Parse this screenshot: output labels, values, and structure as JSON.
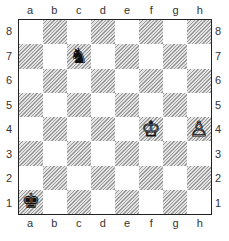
{
  "board": {
    "files": [
      "a",
      "b",
      "c",
      "d",
      "e",
      "f",
      "g",
      "h"
    ],
    "ranks": [
      "8",
      "7",
      "6",
      "5",
      "4",
      "3",
      "2",
      "1"
    ],
    "colors": {
      "light": "#ffffff",
      "dark_hatch": "#9a9a9a",
      "border": "#222222"
    },
    "pieces": [
      {
        "square": "c7",
        "type": "knight",
        "color": "black",
        "glyph": "♞",
        "icon": "black-knight-icon"
      },
      {
        "square": "f4",
        "type": "king",
        "color": "white",
        "glyph": "♔",
        "icon": "white-king-icon"
      },
      {
        "square": "h4",
        "type": "pawn",
        "color": "white",
        "glyph": "♙",
        "icon": "white-pawn-icon"
      },
      {
        "square": "a1",
        "type": "king",
        "color": "black",
        "glyph": "♚",
        "icon": "black-king-icon"
      }
    ]
  },
  "caption": ""
}
